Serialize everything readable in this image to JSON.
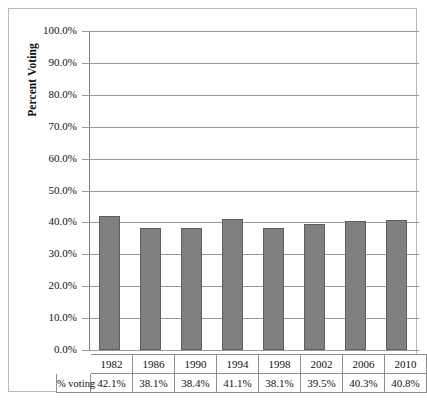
{
  "chart_data": {
    "type": "bar",
    "title": "",
    "xlabel": "",
    "ylabel": "Percent Voting",
    "categories": [
      "1982",
      "1986",
      "1990",
      "1994",
      "1998",
      "2002",
      "2006",
      "2010"
    ],
    "values": [
      42.1,
      38.1,
      38.4,
      41.1,
      38.1,
      39.5,
      40.3,
      40.8
    ],
    "value_labels": [
      "42.1%",
      "38.1%",
      "38.4%",
      "41.1%",
      "38.1%",
      "39.5%",
      "40.3%",
      "40.8%"
    ],
    "series": [
      {
        "name": "% voting",
        "values": [
          42.1,
          38.1,
          38.4,
          41.1,
          38.1,
          39.5,
          40.3,
          40.8
        ]
      }
    ],
    "ylim": [
      0,
      100
    ],
    "ytick_values": [
      0,
      10,
      20,
      30,
      40,
      50,
      60,
      70,
      80,
      90,
      100
    ],
    "ytick_labels": [
      "0.0%",
      "10.0%",
      "20.0%",
      "30.0%",
      "40.0%",
      "50.0%",
      "60.0%",
      "70.0%",
      "80.0%",
      "90.0%",
      "100.0%"
    ],
    "grid": true,
    "legend": "none",
    "bar_color": "#808080",
    "bar_border_color": "#5e5e5e",
    "gridline_color": "#9a9a9a"
  },
  "table": {
    "row_label": "% voting",
    "headers": [
      "1982",
      "1986",
      "1990",
      "1994",
      "1998",
      "2002",
      "2006",
      "2010"
    ],
    "values": [
      "42.1%",
      "38.1%",
      "38.4%",
      "41.1%",
      "38.1%",
      "39.5%",
      "40.3%",
      "40.8%"
    ]
  }
}
